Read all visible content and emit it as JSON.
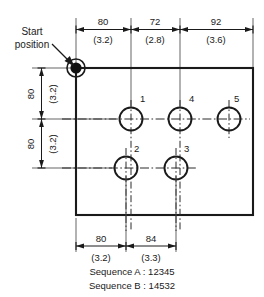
{
  "drawing": {
    "title_note_start": "Start position",
    "top_dimensions": [
      {
        "value": "80",
        "alt": "(3.2)"
      },
      {
        "value": "72",
        "alt": "(2.8)"
      },
      {
        "value": "92",
        "alt": "(3.6)"
      }
    ],
    "left_dimensions": [
      {
        "value": "80",
        "alt": "(3.2)"
      },
      {
        "value": "80",
        "alt": "(3.2)"
      }
    ],
    "bottom_dimensions": [
      {
        "value": "80",
        "alt": "(3.2)"
      },
      {
        "value": "84",
        "alt": "(3.3)"
      }
    ],
    "holes": [
      {
        "label": "1"
      },
      {
        "label": "4"
      },
      {
        "label": "5"
      },
      {
        "label": "2"
      },
      {
        "label": "3"
      }
    ],
    "sequences": [
      "Sequence A : 12345",
      "Sequence B : 14532"
    ],
    "colors": {
      "ink": "#1a1a1a",
      "thin": "#4a4a4a",
      "paper": "#ffffff"
    }
  }
}
